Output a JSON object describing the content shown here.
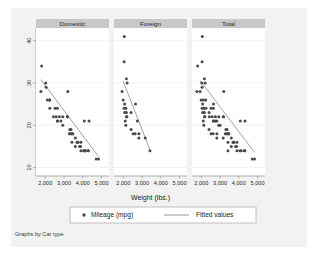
{
  "figure": {
    "caption": "Graphs by Car type",
    "background_color": "#f2f2f2",
    "plot_background_color": "#ffffff",
    "panel_header_color": "#c8c8c8",
    "marker_color": "#4a4a4a",
    "line_color": "#8c8c8c",
    "axis_color": "#9a9a9a",
    "grid_color": "#e8e8e8"
  },
  "chart_data": {
    "type": "scatter",
    "title": "",
    "subtitle": "",
    "xlabel": "Weight (lbs.)",
    "ylabel": "",
    "xlim": [
      1500,
      5400
    ],
    "ylim": [
      8,
      43
    ],
    "xticks": [
      2000,
      3000,
      4000,
      5000
    ],
    "xticklabels": [
      "2,000",
      "3,000",
      "4,000",
      "5,000"
    ],
    "yticks": [
      10,
      20,
      30,
      40
    ],
    "yticklabels": [
      "10",
      "20",
      "30",
      "40"
    ],
    "grid": true,
    "grid_axis": "y",
    "legend": {
      "position": "bottom",
      "entries": [
        {
          "label": "Mileage (mpg)",
          "marker": "circle"
        },
        {
          "label": "Fitted values",
          "marker": "line"
        }
      ]
    },
    "facet_by": "Car type",
    "panels": [
      {
        "label": "Domestic",
        "fit_line": {
          "x": [
            1760,
            4840
          ],
          "y": [
            30.8,
            12.6
          ]
        },
        "points": [
          [
            1800,
            34
          ],
          [
            1760,
            28
          ],
          [
            2020,
            30
          ],
          [
            2040,
            29
          ],
          [
            2230,
            26
          ],
          [
            2230,
            26
          ],
          [
            2110,
            26
          ],
          [
            2240,
            24
          ],
          [
            2430,
            22
          ],
          [
            2520,
            24
          ],
          [
            2580,
            22
          ],
          [
            2650,
            21
          ],
          [
            2640,
            24
          ],
          [
            2750,
            22
          ],
          [
            2830,
            21
          ],
          [
            2930,
            20
          ],
          [
            3200,
            28
          ],
          [
            2930,
            22
          ],
          [
            3180,
            22
          ],
          [
            3310,
            19
          ],
          [
            3280,
            18
          ],
          [
            3330,
            18
          ],
          [
            3370,
            19
          ],
          [
            3420,
            18
          ],
          [
            3430,
            18
          ],
          [
            3470,
            18
          ],
          [
            3600,
            17
          ],
          [
            3690,
            16
          ],
          [
            3720,
            16
          ],
          [
            3740,
            16
          ],
          [
            3830,
            15
          ],
          [
            3880,
            15
          ],
          [
            3900,
            14
          ],
          [
            3900,
            16
          ],
          [
            4060,
            14
          ],
          [
            4080,
            21
          ],
          [
            4130,
            14
          ],
          [
            4130,
            14
          ],
          [
            4290,
            14
          ],
          [
            4330,
            21
          ],
          [
            4290,
            14
          ],
          [
            4060,
            14
          ],
          [
            4720,
            12
          ],
          [
            4840,
            12
          ],
          [
            3170,
            22
          ],
          [
            2640,
            21
          ],
          [
            3420,
            16
          ],
          [
            3600,
            15
          ]
        ]
      },
      {
        "label": "Foreign",
        "fit_line": {
          "x": [
            1980,
            3420
          ],
          "y": [
            30.5,
            14.2
          ]
        },
        "points": [
          [
            2050,
            41
          ],
          [
            2040,
            35
          ],
          [
            2160,
            31
          ],
          [
            2200,
            30
          ],
          [
            1930,
            28
          ],
          [
            1990,
            26
          ],
          [
            2070,
            25
          ],
          [
            2040,
            24
          ],
          [
            2130,
            24
          ],
          [
            2160,
            23
          ],
          [
            2070,
            23
          ],
          [
            2190,
            22
          ],
          [
            2160,
            22
          ],
          [
            2650,
            25
          ],
          [
            2410,
            23
          ],
          [
            2100,
            21
          ],
          [
            2750,
            21
          ],
          [
            2130,
            20
          ],
          [
            2410,
            19
          ],
          [
            2520,
            18
          ],
          [
            2630,
            18
          ],
          [
            2830,
            18
          ],
          [
            3170,
            17
          ],
          [
            3420,
            14
          ],
          [
            2830,
            17
          ]
        ]
      },
      {
        "label": "Total",
        "fit_line": {
          "x": [
            1930,
            4840
          ],
          "y": [
            30.6,
            13.6
          ]
        },
        "points": [
          [
            2050,
            41
          ],
          [
            2040,
            35
          ],
          [
            1800,
            34
          ],
          [
            2160,
            31
          ],
          [
            2200,
            30
          ],
          [
            2020,
            30
          ],
          [
            2040,
            29
          ],
          [
            1930,
            28
          ],
          [
            1760,
            28
          ],
          [
            3200,
            28
          ],
          [
            1990,
            26
          ],
          [
            2230,
            26
          ],
          [
            2110,
            26
          ],
          [
            2070,
            25
          ],
          [
            2650,
            25
          ],
          [
            2040,
            24
          ],
          [
            2130,
            24
          ],
          [
            2240,
            24
          ],
          [
            2520,
            24
          ],
          [
            2640,
            24
          ],
          [
            2160,
            23
          ],
          [
            2070,
            23
          ],
          [
            2410,
            23
          ],
          [
            2190,
            22
          ],
          [
            2160,
            22
          ],
          [
            2430,
            22
          ],
          [
            2580,
            22
          ],
          [
            2930,
            22
          ],
          [
            3180,
            22
          ],
          [
            3170,
            22
          ],
          [
            2100,
            21
          ],
          [
            2650,
            21
          ],
          [
            2750,
            21
          ],
          [
            2640,
            21
          ],
          [
            4080,
            21
          ],
          [
            4330,
            21
          ],
          [
            2130,
            20
          ],
          [
            2930,
            20
          ],
          [
            3310,
            19
          ],
          [
            3370,
            19
          ],
          [
            2410,
            19
          ],
          [
            3280,
            18
          ],
          [
            3330,
            18
          ],
          [
            3420,
            18
          ],
          [
            3430,
            18
          ],
          [
            3470,
            18
          ],
          [
            2520,
            18
          ],
          [
            2630,
            18
          ],
          [
            2830,
            18
          ],
          [
            3600,
            17
          ],
          [
            3170,
            17
          ],
          [
            2830,
            17
          ],
          [
            3690,
            16
          ],
          [
            3720,
            16
          ],
          [
            3740,
            16
          ],
          [
            3900,
            16
          ],
          [
            3420,
            16
          ],
          [
            3830,
            15
          ],
          [
            3880,
            15
          ],
          [
            3600,
            15
          ],
          [
            3900,
            14
          ],
          [
            4060,
            14
          ],
          [
            4130,
            14
          ],
          [
            4290,
            14
          ],
          [
            4330,
            14
          ],
          [
            3420,
            14
          ],
          [
            4720,
            12
          ],
          [
            4840,
            12
          ],
          [
            2750,
            22
          ],
          [
            2830,
            21
          ],
          [
            3000,
            20
          ]
        ]
      }
    ]
  }
}
